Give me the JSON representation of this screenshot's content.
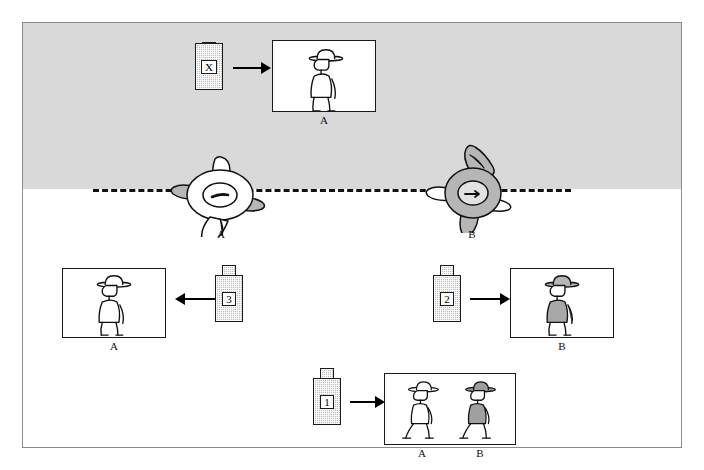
{
  "figure": {
    "background_sky_color": "#d9d9d9",
    "ground_color": "#ffffff",
    "ink_color": "#1a1a1a"
  },
  "horizon": {
    "name": "dashed-horizon-line",
    "style": "dashed"
  },
  "scene": {
    "subjects": [
      {
        "id": "A",
        "label": "A",
        "shading": "light",
        "facing": "down-left"
      },
      {
        "id": "B",
        "label": "B",
        "shading": "dark",
        "facing": "right"
      }
    ]
  },
  "cameras": [
    {
      "id": "X",
      "label": "X",
      "direction": "right",
      "tab": "bottom"
    },
    {
      "id": "3",
      "label": "3",
      "direction": "left",
      "tab": "top"
    },
    {
      "id": "2",
      "label": "2",
      "direction": "right",
      "tab": "top"
    },
    {
      "id": "1",
      "label": "1",
      "direction": "right",
      "tab": "top"
    }
  ],
  "photos": [
    {
      "id": "photo-x",
      "from_camera": "X",
      "captions": [
        "A"
      ],
      "subjects": [
        {
          "label": "A",
          "shading": "light",
          "pose": "profile-left"
        }
      ]
    },
    {
      "id": "photo-3",
      "from_camera": "3",
      "captions": [
        "A"
      ],
      "subjects": [
        {
          "label": "A",
          "shading": "light",
          "pose": "profile-left"
        }
      ]
    },
    {
      "id": "photo-2",
      "from_camera": "2",
      "captions": [
        "B"
      ],
      "subjects": [
        {
          "label": "B",
          "shading": "dark",
          "pose": "profile-left"
        }
      ]
    },
    {
      "id": "photo-1",
      "from_camera": "1",
      "captions": [
        "A",
        "B"
      ],
      "subjects": [
        {
          "label": "A",
          "shading": "light",
          "pose": "walking-left"
        },
        {
          "label": "B",
          "shading": "dark",
          "pose": "walking-left"
        }
      ]
    }
  ],
  "labels": {
    "scene_a": "A",
    "scene_b": "B",
    "photo_x_a": "A",
    "photo_3_a": "A",
    "photo_2_b": "B",
    "photo_1_a": "A",
    "photo_1_b": "B",
    "cam_x": "X",
    "cam_3": "3",
    "cam_2": "2",
    "cam_1": "1"
  }
}
